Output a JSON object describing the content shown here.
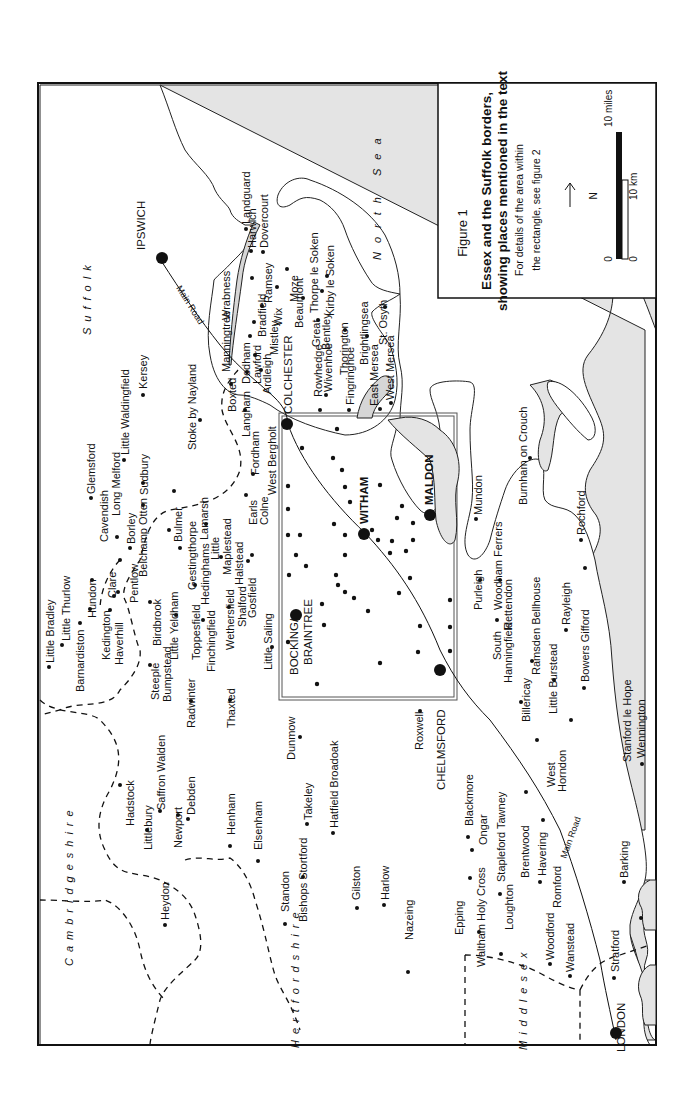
{
  "figure": {
    "label": "Figure 1",
    "title_line1": "Essex and the Suffolk borders,",
    "title_line2": "showing places mentioned in the text",
    "note_line1": "For details of the area within",
    "note_line2": "the rectangle, see figure 2",
    "north_label": "N",
    "scale": {
      "miles_zero": "0",
      "miles_label": "10 miles",
      "km_zero": "0",
      "km_label": "10 km"
    }
  },
  "regions": {
    "suffolk": "Suffolk",
    "north_sea": "North Sea",
    "cambridgeshire": "Cambridgeshire",
    "hertfordshire": "Hertfordshire",
    "middlesex": "Middlesex"
  },
  "roads": {
    "main_road_north": "Main Road",
    "main_road_south": "Main Road"
  },
  "major_towns": {
    "ipswich": "IPSWICH",
    "colchester": "COLCHESTER",
    "witham": "WITHAM",
    "maldon": "MALDON",
    "bocking_line1": "BOCKING/",
    "bocking_line2": "BRAINTREE",
    "chelmsford": "CHELMSFORD",
    "london": "LONDON"
  },
  "places": {
    "landguard": "Landguard",
    "harwich": "Harwich",
    "dovercourt": "Dovercourt",
    "wrabness": "Wrabness",
    "ramsey": "Ramsey",
    "moze": "Moze",
    "thorpe_le_soken": "Thorpe le Soken",
    "kirby_le_soken": "Kirby le Soken",
    "manningtree": "Manningtree",
    "bradfield": "Bradfield",
    "wix": "Wix",
    "beaumont": "Beaumont",
    "mistley": "Mistley",
    "great": "Great",
    "bentley": "Bentley",
    "thorington": "Thorington",
    "brightlingsea": "Brightlingsea",
    "st_osyth": "St. Osyth",
    "dedham": "Dedham",
    "lawford": "Lawford",
    "ardleigh": "Ardleigh",
    "rowhedge": "Rowhedge",
    "wivenhoe": "Wivenhoe",
    "fingringhoe": "Fingringhoe",
    "east_mersea": "East Mersea",
    "west_mersea": "West Mersea",
    "kersey": "Kersey",
    "little_waldingfield": "Little Waldingfield",
    "stoke_by_nayland": "Stoke by Nayland",
    "boxted": "Boxted",
    "langham": "Langham",
    "long_melford": "Long Melford",
    "sudbury": "Sudbury",
    "fordham": "Fordham",
    "west_bergholt": "West Bergholt",
    "glemsford": "Glemsford",
    "cavendish": "Cavendish",
    "borley": "Borley",
    "belchamp_otten": "Belchamp Otten",
    "bulmer": "Bulmer",
    "lamarsh": "Lamarsh",
    "gestingthorpe": "Gestingthorpe",
    "little": "Little",
    "maplestead": "Maplestead",
    "earls": "Earls",
    "colne": "Colne",
    "halstead": "Halstead",
    "hedinghams": "Hedinghams",
    "toppesfield": "Toppesfield",
    "pentlow": "Pentlow",
    "clare": "Clare",
    "hundon": "Hundon",
    "little_bradley": "Little Bradley",
    "little_thurlow": "Little Thurlow",
    "barnardiston": "Barnardiston",
    "kedington": "Kedington",
    "haverhill": "Haverhill",
    "birdbrook": "Birdbrook",
    "little_yeldham": "Little Yeldham",
    "steeple": "Steeple",
    "bumpstead": "Bumpstead",
    "finchingfield": "Finchingfield",
    "wethersfield": "Wethersfield",
    "shalford": "Shalford",
    "gosfield": "Gosfield",
    "little_saling": "Little Saling",
    "radwinter": "Radwinter",
    "thaxted": "Thaxted",
    "dunmow": "Dunmow",
    "hadstock": "Hadstock",
    "littlebury": "Littlebury",
    "saffron_walden": "Saffron Walden",
    "newport": "Newport",
    "debden": "Debden",
    "henham": "Henham",
    "elsenham": "Elsenham",
    "takeley": "Takeley",
    "hatfield_broadoak": "Hatfield Broadoak",
    "heydon": "Heydon",
    "standon": "Standon",
    "bishops_stortford": "Bishops Stortford",
    "gilston": "Gilston",
    "harlow": "Harlow",
    "nazeing": "Nazeing",
    "roxwell": "Roxwell",
    "blackmore": "Blackmore",
    "ongar": "Ongar",
    "stapleford_tawney": "Stapleford Tawney",
    "epping": "Epping",
    "waltham_holy_cross": "Waltham Holy Cross",
    "loughton": "Loughton",
    "brentwood": "Brentwood",
    "havering": "Havering",
    "romford": "Romford",
    "woodford": "Woodford",
    "wanstead": "Wanstead",
    "stratford": "Stratford",
    "barking": "Barking",
    "west": "West",
    "horndon": "Horndon",
    "billericay": "Billericay",
    "little_burstead": "Little Burstead",
    "south": "South",
    "hanningfield": "Hanningfield",
    "ramsden_bellhouse": "Ramsden Bellhouse",
    "rettendon": "Rettendon",
    "woodham_ferrers": "Woodham Ferrers",
    "purleigh": "Purleigh",
    "mundon": "Mundon",
    "burnham_on_crouch": "Burnham on Crouch",
    "rochford": "Rochford",
    "rayleigh": "Rayleigh",
    "bowers_gifford": "Bowers Gifford",
    "stanford_le_hope": "Stanford le Hope",
    "wennington": "Wennington"
  },
  "colors": {
    "sea": "#e4e4e4",
    "land": "#ffffff",
    "ink": "#111111"
  }
}
